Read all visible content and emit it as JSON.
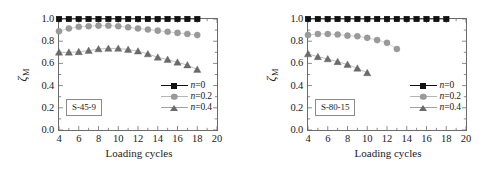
{
  "figure": {
    "panels": [
      {
        "id": "S-45-9",
        "sample_label": "S-45-9",
        "chart_index": 0
      },
      {
        "id": "S-80-15",
        "sample_label": "S-80-15",
        "chart_index": 1
      }
    ]
  },
  "axis": {
    "xlabel": "Loading cycles",
    "ylabel_symbol": "ζ",
    "ylabel_subscript": "M",
    "xticks": [
      "4",
      "6",
      "8",
      "10",
      "12",
      "14",
      "16",
      "18",
      "20"
    ],
    "yticks": [
      "0.0",
      "0.2",
      "0.4",
      "0.6",
      "0.8",
      "1.0"
    ]
  },
  "legend": {
    "entries": [
      {
        "label_var": "n",
        "label_eq": "=0",
        "marker": "square-marker",
        "color": "#111111"
      },
      {
        "label_var": "n",
        "label_eq": "=0.2",
        "marker": "circle-marker",
        "color": "#9a9a9a"
      },
      {
        "label_var": "n",
        "label_eq": "=0.4",
        "marker": "triangle-marker",
        "color": "#6b6b6b"
      }
    ]
  },
  "chart_data": [
    {
      "type": "line",
      "title": "S-45-9",
      "xlabel": "Loading cycles",
      "ylabel": "ζ_M",
      "xlim": [
        4,
        20
      ],
      "ylim": [
        0.0,
        1.0
      ],
      "xticks": [
        4,
        6,
        8,
        10,
        12,
        14,
        16,
        18,
        20
      ],
      "yticks": [
        0.0,
        0.2,
        0.4,
        0.6,
        0.8,
        1.0
      ],
      "grid": false,
      "legend_position": "lower right",
      "annotation": "S-45-9",
      "series": [
        {
          "name": "n=0",
          "marker": "square",
          "color": "#111111",
          "x": [
            4,
            5,
            6,
            7,
            8,
            9,
            10,
            11,
            12,
            13,
            14,
            15,
            16,
            17,
            18
          ],
          "values": [
            1.0,
            1.0,
            1.0,
            1.0,
            1.0,
            1.0,
            1.0,
            1.0,
            1.0,
            1.0,
            1.0,
            1.0,
            1.0,
            1.0,
            1.0
          ]
        },
        {
          "name": "n=0.2",
          "marker": "circle",
          "color": "#9a9a9a",
          "x": [
            4,
            5,
            6,
            7,
            8,
            9,
            10,
            11,
            12,
            13,
            14,
            15,
            16,
            17,
            18
          ],
          "values": [
            0.89,
            0.915,
            0.93,
            0.935,
            0.94,
            0.94,
            0.935,
            0.925,
            0.915,
            0.905,
            0.895,
            0.885,
            0.875,
            0.865,
            0.855
          ]
        },
        {
          "name": "n=0.4",
          "marker": "triangle",
          "color": "#6b6b6b",
          "x": [
            4,
            5,
            6,
            7,
            8,
            9,
            10,
            11,
            12,
            13,
            14,
            15,
            16,
            17,
            18
          ],
          "values": [
            0.7,
            0.7,
            0.705,
            0.715,
            0.73,
            0.735,
            0.735,
            0.725,
            0.71,
            0.685,
            0.655,
            0.635,
            0.61,
            0.585,
            0.545
          ]
        }
      ]
    },
    {
      "type": "line",
      "title": "S-80-15",
      "xlabel": "Loading cycles",
      "ylabel": "ζ_M",
      "xlim": [
        4,
        20
      ],
      "ylim": [
        0.0,
        1.0
      ],
      "xticks": [
        4,
        6,
        8,
        10,
        12,
        14,
        16,
        18,
        20
      ],
      "yticks": [
        0.0,
        0.2,
        0.4,
        0.6,
        0.8,
        1.0
      ],
      "grid": false,
      "legend_position": "lower right",
      "annotation": "S-80-15",
      "series": [
        {
          "name": "n=0",
          "marker": "square",
          "color": "#111111",
          "x": [
            4,
            5,
            6,
            7,
            8,
            9,
            10,
            11,
            12,
            13,
            14,
            15,
            16,
            17,
            18
          ],
          "values": [
            1.0,
            1.0,
            1.0,
            1.0,
            1.0,
            1.0,
            1.0,
            1.0,
            1.0,
            1.0,
            1.0,
            1.0,
            1.0,
            1.0,
            1.0
          ]
        },
        {
          "name": "n=0.2",
          "marker": "circle",
          "color": "#9a9a9a",
          "x": [
            4,
            5,
            6,
            7,
            8,
            9,
            10,
            11,
            12,
            13
          ],
          "values": [
            0.855,
            0.865,
            0.865,
            0.86,
            0.85,
            0.845,
            0.83,
            0.81,
            0.785,
            0.73
          ]
        },
        {
          "name": "n=0.4",
          "marker": "triangle",
          "color": "#6b6b6b",
          "x": [
            4,
            5,
            6,
            7,
            8,
            9,
            10
          ],
          "values": [
            0.685,
            0.66,
            0.64,
            0.615,
            0.59,
            0.555,
            0.515
          ]
        }
      ]
    }
  ]
}
